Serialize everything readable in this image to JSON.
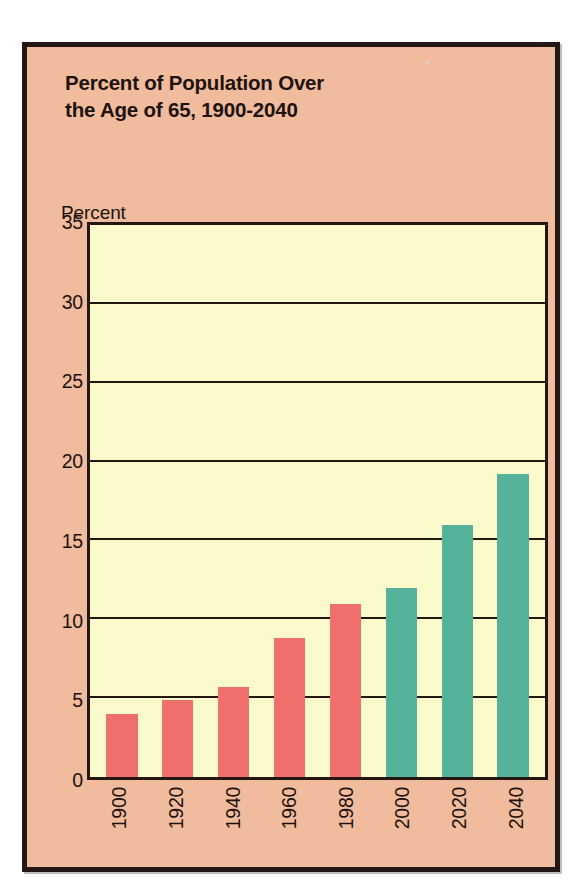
{
  "chart_data": {
    "type": "bar",
    "title": "Percent of Population Over\nthe Age of 65, 1900-2040",
    "xlabel": "",
    "ylabel": "Percent",
    "ylim": [
      0,
      35
    ],
    "yticks": [
      "0",
      "5",
      "10",
      "15",
      "20",
      "25",
      "30",
      "35"
    ],
    "ytick_values": [
      0,
      5,
      10,
      15,
      20,
      25,
      30,
      35
    ],
    "grid": true,
    "legend": "none",
    "categories": [
      "1900",
      "1920",
      "1940",
      "1960",
      "1980",
      "2000",
      "2020",
      "2040"
    ],
    "values": [
      4.0,
      4.9,
      5.7,
      8.8,
      11.0,
      12.0,
      16.0,
      19.2
    ],
    "bar_colors": [
      "#EF6F6C",
      "#EF6F6C",
      "#EF6F6C",
      "#EF6F6C",
      "#EF6F6C",
      "#55B29B",
      "#55B29B",
      "#55B29B"
    ],
    "colors": {
      "historical_bar": "#EF6F6C",
      "projected_bar": "#55B29B",
      "panel_background": "#F1BC9D",
      "plot_background": "#FAFACB",
      "frame": "#241613",
      "text": "#20120F"
    }
  }
}
